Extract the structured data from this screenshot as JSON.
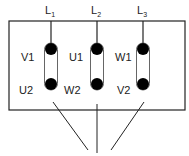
{
  "diagram": {
    "type": "motor-terminal-box-delta-connection",
    "lines": [
      {
        "label": "L",
        "sub": "1",
        "x": 51
      },
      {
        "label": "L",
        "sub": "2",
        "x": 97
      },
      {
        "label": "L",
        "sub": "3",
        "x": 143
      }
    ],
    "terminals": [
      {
        "top": "V1",
        "bottom": "U2",
        "x": 51
      },
      {
        "top": "U1",
        "bottom": "W2",
        "x": 97
      },
      {
        "top": "W1",
        "bottom": "V2",
        "x": 143
      }
    ],
    "colors": {
      "stroke": "#222222",
      "fill": "#000000",
      "background": "#ffffff"
    }
  }
}
